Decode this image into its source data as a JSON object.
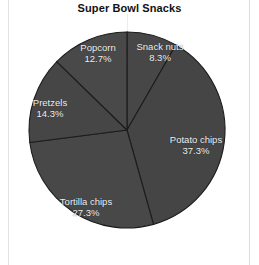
{
  "chart": {
    "title": "Super Bowl Snacks"
  },
  "chart_data": {
    "type": "pie",
    "title": "Super Bowl Snacks",
    "subtitle": "",
    "xlabel": "",
    "ylabel": "",
    "grid": false,
    "legend": "none",
    "labels_inside_slices": true,
    "start_angle_deg": 0,
    "direction": "clockwise",
    "categories": [
      "Snack nuts",
      "Potato chips",
      "Tortilla chips",
      "Pretzels",
      "Popcorn"
    ],
    "values": [
      8.3,
      37.3,
      27.3,
      14.3,
      12.7
    ],
    "value_suffix": "%",
    "slices": [
      {
        "name": "Snack nuts",
        "value": 8.3,
        "value_label": "8.3%",
        "color": "#474747",
        "label_x": 160,
        "label_y": 52
      },
      {
        "name": "Potato chips",
        "value": 37.3,
        "value_label": "37.3%",
        "color": "#454545",
        "label_x": 196,
        "label_y": 145
      },
      {
        "name": "Tortilla chips",
        "value": 27.3,
        "value_label": "27.3%",
        "color": "#484848",
        "label_x": 86,
        "label_y": 207
      },
      {
        "name": "Pretzels",
        "value": 14.3,
        "value_label": "14.3%",
        "color": "#464646",
        "label_x": 50,
        "label_y": 108
      },
      {
        "name": "Popcorn",
        "value": 12.7,
        "value_label": "12.7%",
        "color": "#494949",
        "label_x": 98,
        "label_y": 53
      }
    ],
    "geometry": {
      "center_x": 127,
      "center_y": 130,
      "radius": 98
    },
    "colors": {
      "slice_fill": "#474747",
      "slice_edge": "#1c1c1c",
      "label_text": "#f2f2f2",
      "title_text": "#111111",
      "background": "#ffffff",
      "panel_rule": "#e3e3e3"
    }
  }
}
